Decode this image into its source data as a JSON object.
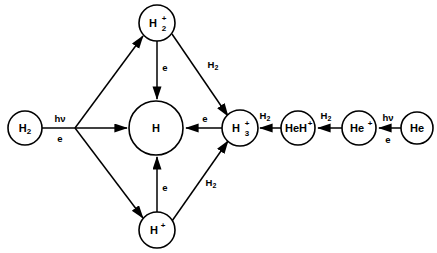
{
  "diagram": {
    "background_color": "#ffffff",
    "stroke_color": "#000000",
    "nodes": [
      {
        "id": "h2",
        "label_main": "H",
        "label_sub": "2",
        "label_sup": "",
        "cx": 25,
        "cy": 128,
        "r": 17
      },
      {
        "id": "h2p",
        "label_main": "H",
        "label_sub": "2",
        "label_sup": "+",
        "cx": 157,
        "cy": 23,
        "r": 18
      },
      {
        "id": "h",
        "label_main": "H",
        "label_sub": "",
        "label_sup": "",
        "cx": 156,
        "cy": 128,
        "r": 27
      },
      {
        "id": "hp",
        "label_main": "H",
        "label_sub": "",
        "label_sup": "+",
        "cx": 157,
        "cy": 230,
        "r": 18
      },
      {
        "id": "h3p",
        "label_main": "H",
        "label_sub": "3",
        "label_sup": "+",
        "cx": 240,
        "cy": 128,
        "r": 18
      },
      {
        "id": "hehp",
        "label_main": "HeH",
        "label_sub": "",
        "label_sup": "+",
        "cx": 298,
        "cy": 128,
        "r": 17
      },
      {
        "id": "hep",
        "label_main": "He",
        "label_sub": "",
        "label_sup": "+",
        "cx": 359,
        "cy": 128,
        "r": 17
      },
      {
        "id": "he",
        "label_main": "He",
        "label_sub": "",
        "label_sup": "",
        "cx": 417,
        "cy": 128,
        "r": 16
      }
    ],
    "edge_labels": [
      {
        "id": "photon-h2",
        "main": "hν",
        "sub": "",
        "x": 60,
        "y": 119
      },
      {
        "id": "electron-h2",
        "main": "e",
        "sub": "",
        "x": 60,
        "y": 139
      },
      {
        "id": "e-h2p-to-h",
        "main": "e",
        "sub": "",
        "x": 165,
        "y": 68
      },
      {
        "id": "h2-h2p-h3p",
        "main": "H",
        "sub": "2",
        "x": 216,
        "y": 65
      },
      {
        "id": "e-h3p-to-h",
        "main": "e",
        "sub": "",
        "x": 205,
        "y": 119
      },
      {
        "id": "e-hp-to-h",
        "main": "e",
        "sub": "",
        "x": 165,
        "y": 188
      },
      {
        "id": "h2-hp-h3p",
        "main": "H",
        "sub": "2",
        "x": 214,
        "y": 183
      },
      {
        "id": "h2-hehp-h3p",
        "main": "H",
        "sub": "2",
        "x": 268,
        "y": 116
      },
      {
        "id": "h2-hep-hehp",
        "main": "H",
        "sub": "2",
        "x": 329,
        "y": 116
      },
      {
        "id": "photon-he",
        "main": "hν",
        "sub": "",
        "x": 388,
        "y": 118
      },
      {
        "id": "electron-he",
        "main": "e",
        "sub": "",
        "x": 388,
        "y": 140
      }
    ],
    "edges": [
      {
        "id": "h2-to-branch",
        "from": "h2",
        "to": "branch-point"
      },
      {
        "id": "branch-to-h2p",
        "from": "branch-point",
        "to": "h2p"
      },
      {
        "id": "branch-to-h",
        "from": "branch-point",
        "to": "h"
      },
      {
        "id": "branch-to-hp",
        "from": "branch-point",
        "to": "hp"
      },
      {
        "id": "h2p-to-h",
        "from": "h2p",
        "to": "h"
      },
      {
        "id": "h2p-to-h3p",
        "from": "h2p",
        "to": "h3p"
      },
      {
        "id": "hp-to-h",
        "from": "hp",
        "to": "h"
      },
      {
        "id": "hp-to-h3p",
        "from": "hp",
        "to": "h3p"
      },
      {
        "id": "h3p-to-h",
        "from": "h3p",
        "to": "h"
      },
      {
        "id": "hehp-to-h3p",
        "from": "hehp",
        "to": "h3p"
      },
      {
        "id": "hep-to-hehp",
        "from": "hep",
        "to": "hehp"
      },
      {
        "id": "he-to-hep",
        "from": "he",
        "to": "hep"
      }
    ]
  }
}
